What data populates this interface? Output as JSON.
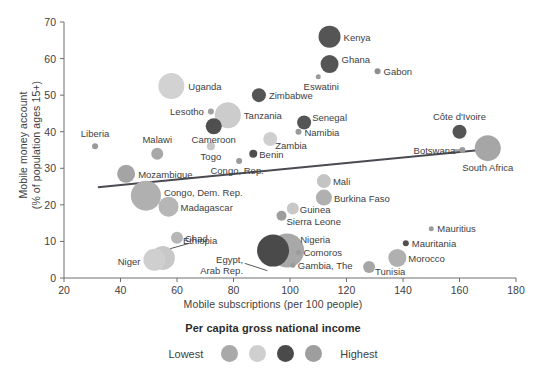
{
  "chart_data": {
    "type": "scatter",
    "title": "",
    "xlabel": "Mobile subscriptions (per 100 people)",
    "ylabel": "Mobile money account\n(% of population ages 15+)",
    "xlim": [
      20,
      180
    ],
    "ylim": [
      0,
      70
    ],
    "xticks": [
      20,
      40,
      60,
      80,
      100,
      120,
      140,
      160,
      180
    ],
    "yticks": [
      0,
      10,
      20,
      30,
      40,
      50,
      60,
      70
    ],
    "grid": false,
    "size_encoding": "population",
    "color_encoding": "Per capita gross national income",
    "trendline": {
      "x0": 32,
      "y0": 24.8,
      "x1": 171,
      "y1": 35.3
    },
    "legend": {
      "title": "Per capita gross national income",
      "low_label": "Lowest",
      "high_label": "Highest",
      "swatches": [
        "#a9a9a9",
        "#cfcfcf",
        "#4a4a4a",
        "#9e9e9e"
      ],
      "position": "bottom"
    },
    "points": [
      {
        "name": "Kenya",
        "x": 114,
        "y": 66,
        "r": 11,
        "color": "#555555",
        "label_dx": 14,
        "label_dy": 4,
        "anchor": "start"
      },
      {
        "name": "Ghana",
        "x": 114,
        "y": 58.5,
        "r": 9,
        "color": "#555555",
        "label_dx": 12,
        "label_dy": -1,
        "anchor": "start"
      },
      {
        "name": "Gabon",
        "x": 131,
        "y": 56.5,
        "r": 3,
        "color": "#8e8e8e",
        "label_dx": 6,
        "label_dy": 3.5,
        "anchor": "start"
      },
      {
        "name": "Eswatini",
        "x": 110,
        "y": 55,
        "r": 2.5,
        "color": "#9a9a9a",
        "label_dx": 3,
        "label_dy": 13,
        "anchor": "middle"
      },
      {
        "name": "Uganda",
        "x": 58,
        "y": 52.5,
        "r": 13,
        "color": "#d2d2d2",
        "label_dx": 17,
        "label_dy": 4,
        "anchor": "start"
      },
      {
        "name": "Zimbabwe",
        "x": 89,
        "y": 50,
        "r": 7,
        "color": "#555555",
        "label_dx": 10,
        "label_dy": 4,
        "anchor": "start"
      },
      {
        "name": "Tanzania",
        "x": 78,
        "y": 44.5,
        "r": 13,
        "color": "#cccccc",
        "label_dx": 16,
        "label_dy": 4,
        "anchor": "start"
      },
      {
        "name": "Lesotho",
        "x": 72,
        "y": 45.5,
        "r": 3,
        "color": "#a0a0a0",
        "label_dx": -7,
        "label_dy": 3.5,
        "anchor": "end"
      },
      {
        "name": "Senegal",
        "x": 105,
        "y": 42.5,
        "r": 7,
        "color": "#555555",
        "label_dx": 8,
        "label_dy": -2,
        "anchor": "start"
      },
      {
        "name": "Côte d'Ivoire",
        "x": 160,
        "y": 40,
        "r": 7,
        "color": "#555555",
        "label_dx": 0,
        "label_dy": -12,
        "anchor": "middle"
      },
      {
        "name": "Cameroon",
        "x": 73,
        "y": 41.5,
        "r": 8,
        "color": "#4f4f4f",
        "label_dx": 0,
        "label_dy": 17,
        "anchor": "middle"
      },
      {
        "name": "Namibia",
        "x": 103,
        "y": 40,
        "r": 3,
        "color": "#9a9a9a",
        "label_dx": 6,
        "label_dy": 4,
        "anchor": "start"
      },
      {
        "name": "Zambia",
        "x": 93,
        "y": 38,
        "r": 7,
        "color": "#cfcfcf",
        "label_dx": 5,
        "label_dy": 10,
        "anchor": "start"
      },
      {
        "name": "Liberia",
        "x": 31,
        "y": 36,
        "r": 3,
        "color": "#9a9a9a",
        "label_dx": 0,
        "label_dy": -9,
        "anchor": "middle"
      },
      {
        "name": "Togo",
        "x": 72,
        "y": 36,
        "r": 4,
        "color": "#c6c6c6",
        "label_dx": 0,
        "label_dy": 14,
        "anchor": "middle"
      },
      {
        "name": "South Africa",
        "x": 170,
        "y": 35.5,
        "r": 13,
        "color": "#a6a6a6",
        "label_dx": 0,
        "label_dy": 23,
        "anchor": "middle"
      },
      {
        "name": "Botswana",
        "x": 161,
        "y": 35,
        "r": 3,
        "color": "#9a9a9a",
        "label_dx": -7,
        "label_dy": 3.5,
        "anchor": "end"
      },
      {
        "name": "Malawi",
        "x": 53,
        "y": 34,
        "r": 6,
        "color": "#a8a8a8",
        "label_dx": 0,
        "label_dy": -11,
        "anchor": "middle"
      },
      {
        "name": "Benin",
        "x": 87,
        "y": 34,
        "r": 4,
        "color": "#4f4f4f",
        "label_dx": 6,
        "label_dy": 4,
        "anchor": "start"
      },
      {
        "name": "Congo, Rep.",
        "x": 82,
        "y": 32,
        "r": 3,
        "color": "#9a9a9a",
        "label_dx": -2,
        "label_dy": 13,
        "anchor": "middle"
      },
      {
        "name": "Mozambique",
        "x": 42,
        "y": 28.5,
        "r": 9,
        "color": "#a4a4a4",
        "label_dx": 12,
        "label_dy": 4,
        "anchor": "start"
      },
      {
        "name": "Mali",
        "x": 112,
        "y": 26.5,
        "r": 7,
        "color": "#c4c4c4",
        "label_dx": 9,
        "label_dy": 4,
        "anchor": "start"
      },
      {
        "name": "Burkina Faso",
        "x": 112,
        "y": 22,
        "r": 8,
        "color": "#b0b0b0",
        "label_dx": 10,
        "label_dy": 4,
        "anchor": "start"
      },
      {
        "name": "Congo, Dem. Rep.",
        "x": 49,
        "y": 22.5,
        "r": 15,
        "color": "#b0b0b0",
        "label_dx": 18,
        "label_dy": 0,
        "anchor": "start"
      },
      {
        "name": "Madagascar",
        "x": 57,
        "y": 19.5,
        "r": 10,
        "color": "#b6b6b6",
        "label_dx": 12,
        "label_dy": 4,
        "anchor": "start"
      },
      {
        "name": "Guinea",
        "x": 101,
        "y": 19,
        "r": 6,
        "color": "#c8c8c8",
        "label_dx": 7,
        "label_dy": 4,
        "anchor": "start"
      },
      {
        "name": "Sierra Leone",
        "x": 97,
        "y": 17,
        "r": 5,
        "color": "#9e9e9e",
        "label_dx": 5,
        "label_dy": 9,
        "anchor": "start"
      },
      {
        "name": "Mauritius",
        "x": 150,
        "y": 13.5,
        "r": 2.5,
        "color": "#9a9a9a",
        "label_dx": 6,
        "label_dy": 3.5,
        "anchor": "start"
      },
      {
        "name": "Chad",
        "x": 60,
        "y": 11,
        "r": 6,
        "color": "#b6b6b6",
        "label_dx": 8,
        "label_dy": 4,
        "anchor": "start"
      },
      {
        "name": "Nigeria",
        "x": 99,
        "y": 7.5,
        "r": 17,
        "color": "#a8a8a8",
        "label_dx": 13,
        "label_dy": -8,
        "anchor": "start"
      },
      {
        "name": "Mauritania",
        "x": 141,
        "y": 9.5,
        "r": 3,
        "color": "#4f4f4f",
        "label_dx": 6,
        "label_dy": 4,
        "anchor": "start"
      },
      {
        "name": "Comoros",
        "x": 103,
        "y": 7,
        "r": 2.5,
        "color": "#9a9a9a",
        "label_dx": 5,
        "label_dy": 3.5,
        "anchor": "start"
      },
      {
        "name": "Morocco",
        "x": 138,
        "y": 5.5,
        "r": 9,
        "color": "#b0b0b0",
        "label_dx": 11,
        "label_dy": 4,
        "anchor": "start"
      },
      {
        "name": "Egypt, Arab Rep.",
        "x": 94,
        "y": 7.5,
        "r": 16,
        "color": "#4a4a4a",
        "label_dx": -30,
        "label_dy": 12,
        "anchor": "end"
      },
      {
        "name": "Gambia, The",
        "x": 101,
        "y": 3.5,
        "r": 2.5,
        "color": "#9a9a9a",
        "label_dx": 5,
        "label_dy": 3.5,
        "anchor": "start"
      },
      {
        "name": "Ethiopia",
        "x": 55,
        "y": 5.5,
        "r": 12,
        "color": "#c8c8c8",
        "label_dx": 20,
        "label_dy": -14,
        "anchor": "start"
      },
      {
        "name": "Niger",
        "x": 52,
        "y": 5,
        "r": 11,
        "color": "#cfcfcf",
        "label_dx": -14,
        "label_dy": 5,
        "anchor": "end"
      },
      {
        "name": "Tunisia",
        "x": 128,
        "y": 3,
        "r": 6,
        "color": "#a6a6a6",
        "label_dx": 6,
        "label_dy": 8,
        "anchor": "start"
      }
    ],
    "leader_lines": [
      {
        "from_label": "Ethiopia",
        "x1": 57.5,
        "y1": 8.0,
        "x2": 64.5,
        "y2": 9.5
      },
      {
        "from_label": "Egypt, Arab Rep.",
        "x1": 84,
        "y1": 4.0,
        "x2": 92,
        "y2": 2.0
      },
      {
        "from_label": "Botswana",
        "x1": 158,
        "y1": 35.0,
        "x2": 161,
        "y2": 35.0
      }
    ]
  }
}
